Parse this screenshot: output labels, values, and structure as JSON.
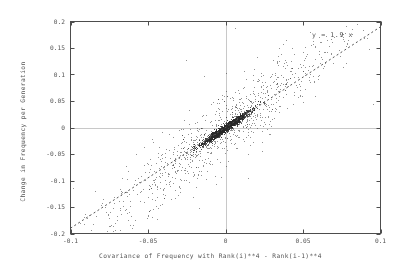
{
  "chart_data": {
    "type": "scatter",
    "title": "",
    "xlabel": "Covariance of Frequency with Rank(i)**4 - Rank(i-1)**4",
    "ylabel": "Change in Frequency per Generation",
    "xlim": [
      -0.1,
      0.1
    ],
    "ylim": [
      -0.2,
      0.2
    ],
    "xticks": [
      "-0.1",
      "-0.05",
      "0",
      "0.05",
      "0.1"
    ],
    "xtick_values": [
      -0.1,
      -0.05,
      0,
      0.05,
      0.1
    ],
    "yticks": [
      "0.2",
      "0.15",
      "0.1",
      "0.05",
      "0",
      "-0.05",
      "-0.1",
      "-0.15",
      "-0.2"
    ],
    "ytick_values": [
      0.2,
      0.15,
      0.1,
      0.05,
      0,
      -0.05,
      -0.1,
      -0.15,
      -0.2
    ],
    "grid": false,
    "legend": "none",
    "point_color": "#333333",
    "point_count": 2400,
    "point_size_px": 1,
    "marker": "dot",
    "zero_lines": {
      "x": 0,
      "y": 0,
      "color": "#c8c8c8"
    },
    "fit_line": {
      "label": "y = 1.9 x",
      "slope": 1.9,
      "intercept": 0,
      "style": "dashed",
      "color": "#555555",
      "x_from": -0.1,
      "x_to": 0.1
    },
    "distribution": {
      "description": "Dense elongated cluster at origin aligned with the fit line, plus sparse scatter spreading outward along the same diagonal.",
      "correlation": 0.62,
      "core_sigma_x": 0.0075,
      "core_sigma_perp": 0.0042,
      "halo_sigma_x": 0.031,
      "halo_sigma_perp": 0.03,
      "core_fraction": 0.58
    },
    "series": [
      {
        "name": "frequency change vs rank covariance",
        "points_summary": "See distribution parameters; points generated about the y = 1.9x axis."
      }
    ]
  },
  "fit_annotation": "y = 1.9 x",
  "axes": {
    "x_label": "Covariance of Frequency with Rank(i)**4 - Rank(i-1)**4",
    "y_label": "Change in Frequency per Generation"
  }
}
